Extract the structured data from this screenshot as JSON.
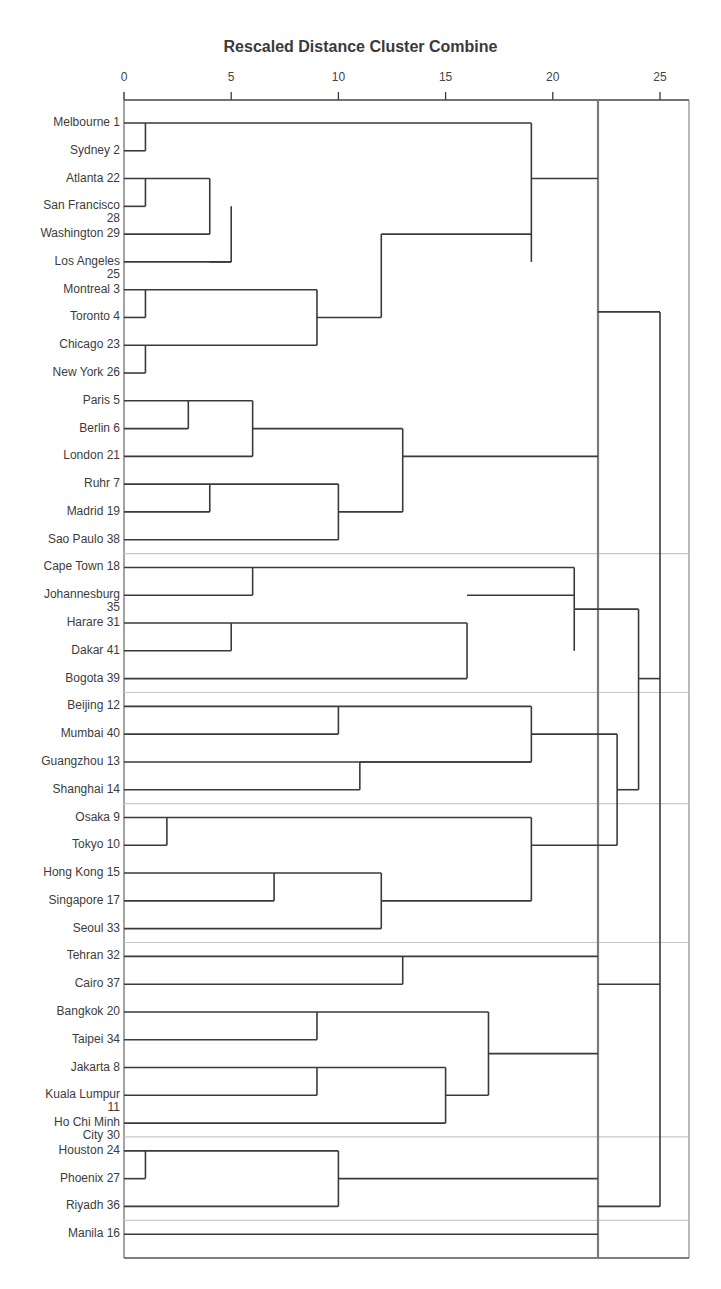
{
  "chart_data": {
    "type": "dendrogram",
    "title": "Rescaled Distance Cluster Combine",
    "xlabel": "",
    "ylabel": "",
    "xlim": [
      0,
      26.5
    ],
    "x_ticks": [
      0,
      5,
      10,
      15,
      20,
      25
    ],
    "x_tick_labels": [
      "0",
      "5",
      "10",
      "15",
      "20",
      "25"
    ],
    "cut_line_distance": 22.1,
    "grid": false,
    "leaves": [
      {
        "label": "Melbourne 1"
      },
      {
        "label": "Sydney 2"
      },
      {
        "label": "Atlanta 22"
      },
      {
        "label": "San Francisco\n28"
      },
      {
        "label": "Washington 29"
      },
      {
        "label": "Los Angeles\n25"
      },
      {
        "label": "Montreal 3"
      },
      {
        "label": "Toronto 4"
      },
      {
        "label": "Chicago 23"
      },
      {
        "label": "New York 26"
      },
      {
        "label": "Paris 5"
      },
      {
        "label": "Berlin 6"
      },
      {
        "label": "London 21"
      },
      {
        "label": "Ruhr 7"
      },
      {
        "label": "Madrid 19"
      },
      {
        "label": "Sao Paulo 38"
      },
      {
        "label": "Cape Town 18"
      },
      {
        "label": "Johannesburg\n35"
      },
      {
        "label": "Harare 31"
      },
      {
        "label": "Dakar 41"
      },
      {
        "label": "Bogota 39"
      },
      {
        "label": "Beijing 12"
      },
      {
        "label": "Mumbai 40"
      },
      {
        "label": "Guangzhou 13"
      },
      {
        "label": "Shanghai 14"
      },
      {
        "label": "Osaka 9"
      },
      {
        "label": "Tokyo 10"
      },
      {
        "label": "Hong Kong 15"
      },
      {
        "label": "Singapore 17"
      },
      {
        "label": "Seoul 33"
      },
      {
        "label": "Tehran 32"
      },
      {
        "label": "Cairo 37"
      },
      {
        "label": "Bangkok 20"
      },
      {
        "label": "Taipei 34"
      },
      {
        "label": "Jakarta 8"
      },
      {
        "label": "Kuala Lumpur\n11"
      },
      {
        "label": "Ho Chi Minh\nCity 30"
      },
      {
        "label": "Houston 24"
      },
      {
        "label": "Phoenix 27"
      },
      {
        "label": "Riyadh 36"
      },
      {
        "label": "Manila 16"
      }
    ],
    "merges": [
      {
        "a": "Melbourne 1",
        "b": "Sydney 2",
        "distance": 1
      },
      {
        "a": "Atlanta 22",
        "b": "San Francisco 28",
        "distance": 1
      },
      {
        "a": "Atlanta+SanFrancisco",
        "b": "Washington 29",
        "distance": 4
      },
      {
        "a": "Atlanta+SanFrancisco+Washington",
        "b": "Los Angeles 25",
        "distance": 5
      },
      {
        "a": "Montreal 3",
        "b": "Toronto 4",
        "distance": 1
      },
      {
        "a": "Chicago 23",
        "b": "New York 26",
        "distance": 1
      },
      {
        "a": "Montreal+Toronto",
        "b": "Chicago+NewYork",
        "distance": 9
      },
      {
        "a": "Atlanta..LosAngeles",
        "b": "Montreal..NewYork",
        "distance": 12
      },
      {
        "a": "Melbourne+Sydney",
        "b": "US/Canada group",
        "distance": 19
      },
      {
        "a": "Paris 5",
        "b": "Berlin 6",
        "distance": 3
      },
      {
        "a": "Paris+Berlin",
        "b": "London 21",
        "distance": 6
      },
      {
        "a": "Ruhr 7",
        "b": "Madrid 19",
        "distance": 4
      },
      {
        "a": "Ruhr+Madrid",
        "b": "Sao Paulo 38",
        "distance": 10
      },
      {
        "a": "Paris..London",
        "b": "Ruhr..SaoPaulo",
        "distance": 13
      },
      {
        "a": "Cape Town 18",
        "b": "Johannesburg 35",
        "distance": 6
      },
      {
        "a": "Harare 31",
        "b": "Dakar 41",
        "distance": 5
      },
      {
        "a": "Harare+Dakar",
        "b": "Bogota 39",
        "distance": 16
      },
      {
        "a": "CapeTown+Johannesburg",
        "b": "Harare..Bogota",
        "distance": 21
      },
      {
        "a": "Beijing 12",
        "b": "Mumbai 40",
        "distance": 10
      },
      {
        "a": "Guangzhou 13",
        "b": "Shanghai 14",
        "distance": 11
      },
      {
        "a": "Beijing+Mumbai",
        "b": "Guangzhou+Shanghai",
        "distance": 19
      },
      {
        "a": "Osaka 9",
        "b": "Tokyo 10",
        "distance": 2
      },
      {
        "a": "Hong Kong 15",
        "b": "Singapore 17",
        "distance": 7
      },
      {
        "a": "HongKong+Singapore",
        "b": "Seoul 33",
        "distance": 12
      },
      {
        "a": "Osaka+Tokyo",
        "b": "HongKong..Seoul",
        "distance": 19
      },
      {
        "a": "Beijing..Shanghai",
        "b": "Osaka..Seoul",
        "distance": 23
      },
      {
        "a": "CapeTown..Bogota",
        "b": "Beijing..Seoul",
        "distance": 24
      },
      {
        "a": "Tehran 32",
        "b": "Cairo 37",
        "distance": 13
      },
      {
        "a": "Bangkok 20",
        "b": "Taipei 34",
        "distance": 9
      },
      {
        "a": "Jakarta 8",
        "b": "Kuala Lumpur 11",
        "distance": 9
      },
      {
        "a": "Jakarta+KualaLumpur",
        "b": "Ho Chi Minh City 30",
        "distance": 15
      },
      {
        "a": "Bangkok+Taipei",
        "b": "Jakarta..HoChiMinh",
        "distance": 17
      },
      {
        "a": "Tehran+Cairo",
        "b": "Bangkok..HoChiMinh",
        "distance": 22
      },
      {
        "a": "Houston 24",
        "b": "Phoenix 27",
        "distance": 1
      },
      {
        "a": "Houston+Phoenix",
        "b": "Riyadh 36",
        "distance": 10
      },
      {
        "a": "Melbourne..NewYork",
        "b": "Paris..SaoPaulo",
        "distance": 22
      },
      {
        "a": "Manila 16",
        "b": "(all)",
        "distance": 22
      },
      {
        "a": "Global/Europe-Americas",
        "b": "Africa+Asia groups",
        "distance": 25
      }
    ],
    "separator_after_leaf_indices": [
      15,
      20,
      24,
      29,
      36,
      39
    ]
  },
  "layout": {
    "x0": 124,
    "px_per_unit": 21.44,
    "row0_y": 123,
    "row_step": 27.78,
    "axis_y": 100,
    "frame_right": 689,
    "frame_bottom": 1258,
    "cut_x": 598,
    "line_color": "#3a3a3a",
    "separator_color": "#c8c8c8",
    "cut_color": "#7a7a7a"
  },
  "segments": [
    [
      0,
      0,
      19,
      0
    ],
    [
      1,
      1,
      1,
      1
    ],
    [
      2,
      2,
      4,
      2
    ],
    [
      3,
      3,
      1,
      3
    ],
    [
      4,
      4,
      4,
      4
    ],
    [
      5,
      5,
      5,
      5
    ],
    [
      6,
      6,
      9,
      6
    ],
    [
      7,
      7,
      1,
      7
    ],
    [
      8,
      8,
      9,
      8
    ],
    [
      9,
      9,
      1,
      9
    ],
    [
      10,
      10,
      6,
      10
    ],
    [
      11,
      11,
      3,
      11
    ],
    [
      12,
      12,
      6,
      12
    ],
    [
      13,
      13,
      10,
      13
    ],
    [
      14,
      14,
      4,
      14
    ],
    [
      15,
      15,
      10,
      15
    ],
    [
      16,
      16,
      21,
      16
    ],
    [
      17,
      17,
      6,
      17
    ],
    [
      18,
      18,
      16,
      18
    ],
    [
      19,
      19,
      5,
      19
    ],
    [
      20,
      20,
      16,
      20
    ],
    [
      21,
      21,
      19,
      21
    ],
    [
      22,
      22,
      10,
      22
    ],
    [
      23,
      23,
      19,
      23
    ],
    [
      24,
      24,
      11,
      24
    ],
    [
      25,
      25,
      19,
      25
    ],
    [
      26,
      26,
      2,
      26
    ],
    [
      27,
      27,
      12,
      27
    ],
    [
      28,
      28,
      7,
      28
    ],
    [
      29,
      29,
      12,
      29
    ],
    [
      30,
      30,
      22.1,
      30
    ],
    [
      31,
      31,
      13,
      31
    ],
    [
      32,
      32,
      17,
      32
    ],
    [
      33,
      33,
      9,
      33
    ],
    [
      34,
      34,
      15,
      34
    ],
    [
      35,
      35,
      9,
      35
    ],
    [
      36,
      36,
      15,
      36
    ],
    [
      37,
      37,
      10,
      37
    ],
    [
      38,
      38,
      1,
      38
    ],
    [
      39,
      39,
      10,
      39
    ],
    [
      40,
      40,
      22.1,
      40
    ]
  ],
  "verticals": [
    {
      "x": 1,
      "y1": 0,
      "y2": 1
    },
    {
      "x": 1,
      "y1": 2,
      "y2": 3
    },
    {
      "x": 4,
      "y1": 2,
      "y2": 4
    },
    {
      "x": 5,
      "y1": 3,
      "y2": 5
    },
    {
      "x": 1,
      "y1": 6,
      "y2": 7
    },
    {
      "x": 1,
      "y1": 8,
      "y2": 9
    },
    {
      "x": 9,
      "y1": 6,
      "y2": 8
    },
    {
      "x": 12,
      "y1": 4,
      "y2": 7
    },
    {
      "x": 19,
      "y1": 0,
      "y2": 5
    },
    {
      "x": 3,
      "y1": 10,
      "y2": 11
    },
    {
      "x": 6,
      "y1": 10,
      "y2": 12
    },
    {
      "x": 4,
      "y1": 13,
      "y2": 14
    },
    {
      "x": 10,
      "y1": 13,
      "y2": 15
    },
    {
      "x": 13,
      "y1": 11,
      "y2": 14
    },
    {
      "x": 6,
      "y1": 16,
      "y2": 17
    },
    {
      "x": 5,
      "y1": 18,
      "y2": 19
    },
    {
      "x": 16,
      "y1": 18,
      "y2": 20
    },
    {
      "x": 21,
      "y1": 16,
      "y2": 19
    },
    {
      "x": 10,
      "y1": 21,
      "y2": 22
    },
    {
      "x": 11,
      "y1": 23,
      "y2": 24
    },
    {
      "x": 19,
      "y1": 21,
      "y2": 23
    },
    {
      "x": 2,
      "y1": 25,
      "y2": 26
    },
    {
      "x": 7,
      "y1": 27,
      "y2": 28
    },
    {
      "x": 12,
      "y1": 27,
      "y2": 29
    },
    {
      "x": 19,
      "y1": 25,
      "y2": 28
    },
    {
      "x": 13,
      "y1": 30,
      "y2": 31
    },
    {
      "x": 9,
      "y1": 32,
      "y2": 33
    },
    {
      "x": 9,
      "y1": 34,
      "y2": 35
    },
    {
      "x": 15,
      "y1": 34,
      "y2": 36
    },
    {
      "x": 17,
      "y1": 32,
      "y2": 35
    },
    {
      "x": 1,
      "y1": 37,
      "y2": 38
    },
    {
      "x": 10,
      "y1": 37,
      "y2": 39
    }
  ],
  "connectors": [
    {
      "y": 2,
      "x1": 19,
      "x2": 22.1
    },
    {
      "y": 12,
      "x1": 13,
      "x2": 22.1
    },
    {
      "y": 33.5,
      "x1": 17,
      "x2": 22.1
    },
    {
      "y": 38,
      "x1": 10,
      "x2": 22.1
    },
    {
      "y": 5,
      "x1": 4,
      "x2": 5
    },
    {
      "y": 7,
      "x1": 9,
      "x2": 12
    },
    {
      "y": 4,
      "x1": 12,
      "x2": 19
    },
    {
      "y": 11,
      "x1": 6,
      "x2": 13
    },
    {
      "y": 14,
      "x1": 10,
      "x2": 13
    },
    {
      "y": 17,
      "x1": 16,
      "x2": 21
    },
    {
      "y": 23,
      "x1": 11,
      "x2": 19
    },
    {
      "y": 28,
      "x1": 12,
      "x2": 19
    },
    {
      "y": 35,
      "x1": 15,
      "x2": 17
    },
    {
      "y": 6.8,
      "x1": 22.1,
      "x2": 25
    },
    {
      "y": 17.5,
      "x1": 21,
      "x2": 24
    },
    {
      "y": 22,
      "x1": 19,
      "x2": 23
    },
    {
      "y": 26,
      "x1": 19,
      "x2": 23
    },
    {
      "y": 24,
      "x1": 23,
      "x2": 24
    },
    {
      "y": 20,
      "x1": 24,
      "x2": 25
    },
    {
      "y": 31,
      "x1": 22.1,
      "x2": 25
    },
    {
      "y": 39,
      "x1": 22.1,
      "x2": 25
    }
  ],
  "upper_verticals": [
    {
      "x": 23,
      "y1": 22,
      "y2": 26
    },
    {
      "x": 24,
      "y1": 17.5,
      "y2": 24
    },
    {
      "x": 25,
      "y1": 6.8,
      "y2": 39
    }
  ]
}
